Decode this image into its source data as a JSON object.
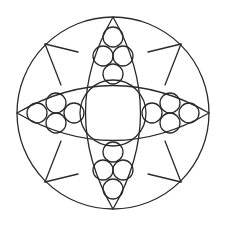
{
  "diagram": {
    "type": "geometric-mandala",
    "canvas": {
      "width": 226,
      "height": 226,
      "background": "#ffffff"
    },
    "stroke_color": "#2a2a2a",
    "outer_circle": {
      "cx": 113,
      "cy": 113,
      "r": 96
    },
    "center_circle": {
      "cx": 113,
      "cy": 113,
      "r": 33
    },
    "lenses": [
      {
        "name": "vertical-lens",
        "path": "M113,17 Q168,113 113,209 Q58,113 113,17 Z"
      },
      {
        "name": "horizontal-lens",
        "path": "M17,113 Q113,58 209,113 Q113,168 17,113 Z"
      }
    ],
    "small_circle_groups": [
      {
        "name": "top",
        "circles": [
          {
            "cx": 113,
            "cy": 37,
            "r": 10
          },
          {
            "cx": 103,
            "cy": 56,
            "r": 10
          },
          {
            "cx": 123,
            "cy": 56,
            "r": 10
          },
          {
            "cx": 113,
            "cy": 74,
            "r": 10
          }
        ]
      },
      {
        "name": "bottom",
        "circles": [
          {
            "cx": 113,
            "cy": 189,
            "r": 10
          },
          {
            "cx": 103,
            "cy": 170,
            "r": 10
          },
          {
            "cx": 123,
            "cy": 170,
            "r": 10
          },
          {
            "cx": 113,
            "cy": 152,
            "r": 10
          }
        ]
      },
      {
        "name": "left",
        "circles": [
          {
            "cx": 37,
            "cy": 113,
            "r": 10
          },
          {
            "cx": 56,
            "cy": 103,
            "r": 10
          },
          {
            "cx": 56,
            "cy": 123,
            "r": 10
          },
          {
            "cx": 74,
            "cy": 113,
            "r": 10
          }
        ]
      },
      {
        "name": "right",
        "circles": [
          {
            "cx": 189,
            "cy": 113,
            "r": 10
          },
          {
            "cx": 170,
            "cy": 103,
            "r": 10
          },
          {
            "cx": 170,
            "cy": 123,
            "r": 10
          },
          {
            "cx": 152,
            "cy": 113,
            "r": 10
          }
        ]
      }
    ],
    "diagonal_kites": [
      {
        "name": "top-left",
        "vertex": [
          45,
          44
        ],
        "a": [
          78,
          52
        ],
        "b": [
          61,
          85
        ]
      },
      {
        "name": "top-right",
        "vertex": [
          181,
          44
        ],
        "a": [
          148,
          52
        ],
        "b": [
          165,
          85
        ]
      },
      {
        "name": "bottom-left",
        "vertex": [
          45,
          182
        ],
        "a": [
          78,
          174
        ],
        "b": [
          61,
          141
        ]
      },
      {
        "name": "bottom-right",
        "vertex": [
          181,
          182
        ],
        "a": [
          148,
          174
        ],
        "b": [
          165,
          141
        ]
      }
    ]
  }
}
